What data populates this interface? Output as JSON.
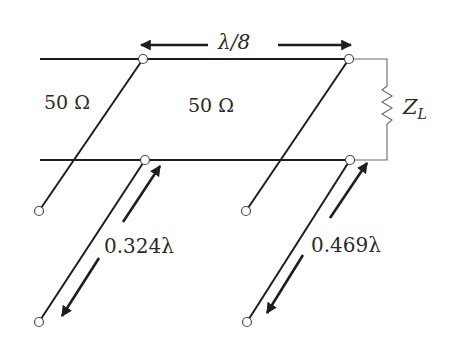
{
  "diagram": {
    "labels": {
      "line_impedance_left": "50 Ω",
      "line_impedance_main": "50 Ω",
      "stub_spacing": "λ/8",
      "load": "Z",
      "load_subscript": "L",
      "stub1_length": "0.324λ",
      "stub2_length": "0.469λ"
    },
    "colors": {
      "line": "#1e1e1e",
      "load_wire": "#6a6a6a",
      "node_fill": "#ffffff"
    }
  }
}
